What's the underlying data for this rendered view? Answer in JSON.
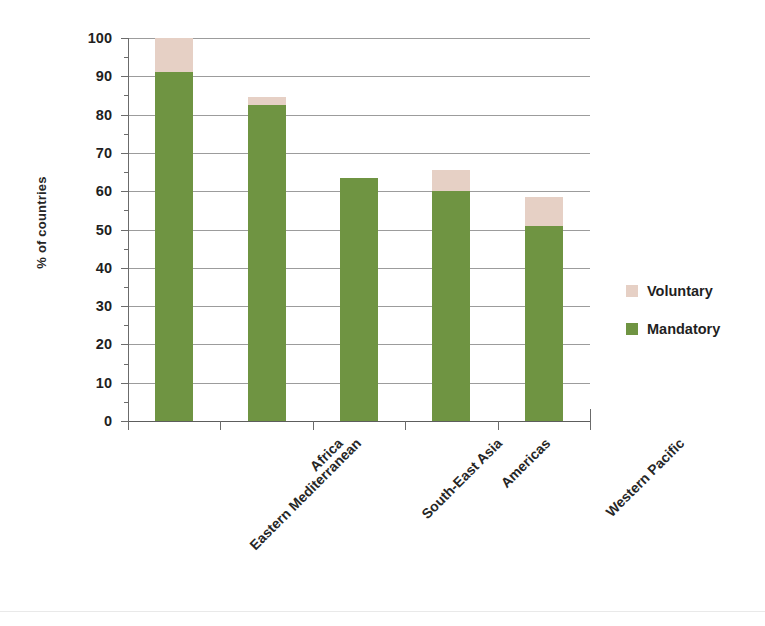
{
  "chart_data": {
    "type": "bar",
    "stacked": true,
    "title": "",
    "subtitle": "",
    "xlabel": "",
    "ylabel": "% of countries",
    "ylim": [
      0,
      100
    ],
    "ytick_step": 10,
    "yticks": [
      100,
      90,
      80,
      70,
      60,
      50,
      40,
      30,
      20,
      10,
      0
    ],
    "grid": true,
    "grid_axis": "y",
    "legend_position": "right",
    "categories": [
      "Eastern Mediterranean",
      "Africa",
      "South-East Asia",
      "Americas",
      "Western Pacific"
    ],
    "series": [
      {
        "name": "Mandatory",
        "color": "#6f9442",
        "values": [
          91,
          82.5,
          63.5,
          60,
          51
        ]
      },
      {
        "name": "Voluntary",
        "color": "#e6d0c5",
        "values": [
          9,
          2,
          0,
          5.5,
          7.5
        ]
      }
    ],
    "totals": [
      100,
      84.5,
      63.5,
      65.5,
      58.5
    ]
  },
  "legend": {
    "items": [
      {
        "label": "Voluntary",
        "color": "#e6d0c5"
      },
      {
        "label": "Mandatory",
        "color": "#6f9442"
      }
    ]
  },
  "axis": {
    "y_title": "% of countries"
  }
}
